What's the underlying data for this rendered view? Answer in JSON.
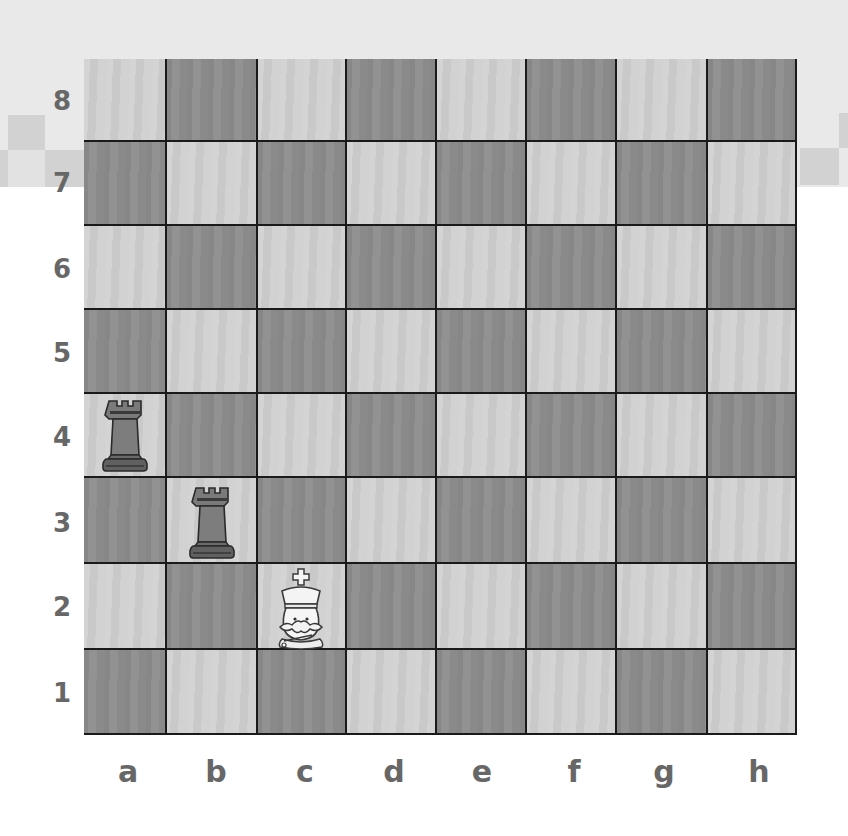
{
  "board": {
    "files": [
      "a",
      "b",
      "c",
      "d",
      "e",
      "f",
      "g",
      "h"
    ],
    "ranks": [
      "8",
      "7",
      "6",
      "5",
      "4",
      "3",
      "2",
      "1"
    ],
    "orientation": "white-bottom",
    "light_square_color": "#cfcfcf",
    "dark_square_color": "#8e8e8e",
    "border_color": "#1a1a1a"
  },
  "pieces": [
    {
      "type": "rook",
      "color": "black",
      "square": "a4",
      "icon": "black-rook-icon"
    },
    {
      "type": "rook",
      "color": "black",
      "square": "b3",
      "icon": "black-rook-icon"
    },
    {
      "type": "king",
      "color": "white",
      "square": "c2",
      "icon": "white-king-icon"
    }
  ],
  "labels": {
    "rank_8": "8",
    "rank_7": "7",
    "rank_6": "6",
    "rank_5": "5",
    "rank_4": "4",
    "rank_3": "3",
    "rank_2": "2",
    "rank_1": "1",
    "file_a": "a",
    "file_b": "b",
    "file_c": "c",
    "file_d": "d",
    "file_e": "e",
    "file_f": "f",
    "file_g": "g",
    "file_h": "h"
  },
  "colors": {
    "label": "#676767",
    "background_band": "#e9e9e9",
    "checker_pattern": "#d2d2d2"
  }
}
